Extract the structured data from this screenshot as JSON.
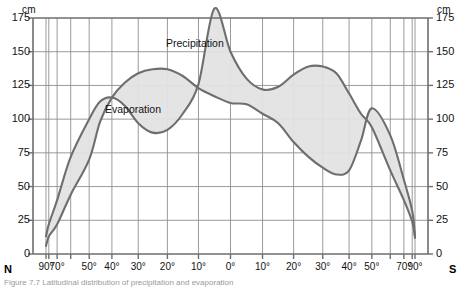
{
  "axes": {
    "y_unit_left": "cm",
    "y_unit_right": "cm",
    "y_ticks": [
      "0",
      "25",
      "50",
      "75",
      "100",
      "125",
      "150",
      "175"
    ],
    "x_ticks_labeled": [
      "90°",
      "70°",
      "50°",
      "40°",
      "30°",
      "20°",
      "10°",
      "0°",
      "10°",
      "20°",
      "30°",
      "40°",
      "50°",
      "70°",
      "90°"
    ],
    "pole_north": "N",
    "pole_south": "S"
  },
  "labels": {
    "evaporation": "Evaporation",
    "precipitation": "Precipitation"
  },
  "caption": "Figure 7.7 Latitudinal distribution of precipitation and evaporation",
  "colors": {
    "curve": "#6e6e6e",
    "fill": "#e2e2e2",
    "grid": "#8a8a8a",
    "axis": "#6e6e6e",
    "text": "#111111"
  },
  "chart_data": {
    "type": "line",
    "title": "",
    "xlabel": "Latitude",
    "ylabel": "cm",
    "ylim": [
      0,
      175
    ],
    "grid": true,
    "legend": "inline-annotations",
    "x_axis_note": "Latitude from 90°N (left) through 0° (center) to 90°S (right); spacing compressed poleward (sine projection)",
    "x": [
      90,
      80,
      70,
      60,
      50,
      45,
      40,
      35,
      30,
      25,
      20,
      15,
      10,
      5,
      0,
      -5,
      -10,
      -15,
      -20,
      -25,
      -30,
      -35,
      -40,
      -45,
      -50,
      -60,
      -70,
      -80,
      -90
    ],
    "x_labels": [
      "90°N",
      "80°N",
      "70°N",
      "60°N",
      "50°N",
      "45°N",
      "40°N",
      "35°N",
      "30°N",
      "25°N",
      "20°N",
      "15°N",
      "10°N",
      "5°N",
      "0°",
      "5°S",
      "10°S",
      "15°S",
      "20°S",
      "25°S",
      "30°S",
      "35°S",
      "40°S",
      "45°S",
      "50°S",
      "60°S",
      "70°S",
      "80°S",
      "90°S"
    ],
    "series": [
      {
        "name": "Precipitation",
        "values": [
          13,
          22,
          40,
          72,
          100,
          113,
          116,
          110,
          97,
          90,
          92,
          104,
          126,
          182,
          150,
          130,
          122,
          124,
          133,
          139,
          139,
          134,
          119,
          104,
          94,
          62,
          40,
          24,
          12
        ],
        "unit": "cm"
      },
      {
        "name": "Evaporation",
        "values": [
          6,
          13,
          22,
          44,
          70,
          98,
          116,
          127,
          134,
          137,
          137,
          132,
          123,
          117,
          112,
          111,
          104,
          97,
          83,
          72,
          64,
          59,
          62,
          84,
          108,
          88,
          55,
          32,
          13
        ],
        "unit": "cm"
      }
    ]
  }
}
